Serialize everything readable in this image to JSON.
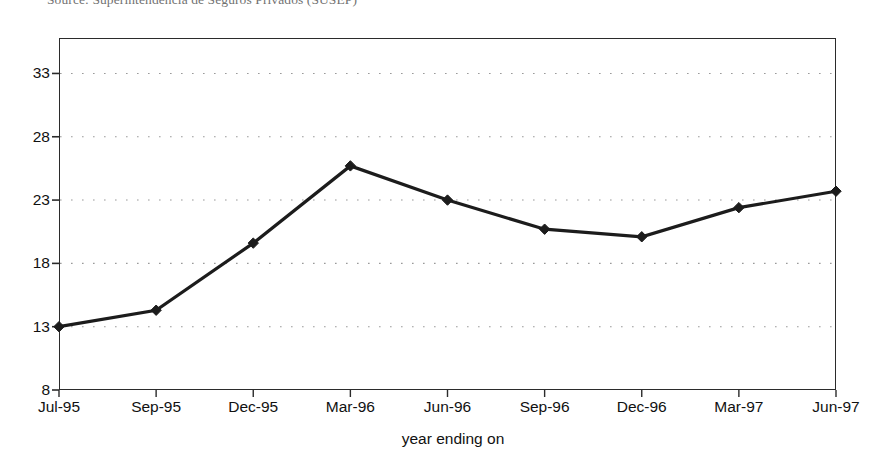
{
  "caption": {
    "source_text": "Source: Superintendência de Seguros Privados (SUSEP)"
  },
  "chart_data": {
    "type": "line",
    "title": "",
    "xlabel": "year ending on",
    "ylabel": "",
    "categories": [
      "Jul-95",
      "Sep-95",
      "Dec-95",
      "Mar-96",
      "Jun-96",
      "Sep-96",
      "Dec-96",
      "Mar-97",
      "Jun-97"
    ],
    "values": [
      13.0,
      14.3,
      19.6,
      25.7,
      23.0,
      20.7,
      20.1,
      22.4,
      23.7
    ],
    "series": [
      {
        "name": "series-1",
        "values": [
          13.0,
          14.3,
          19.6,
          25.7,
          23.0,
          20.7,
          20.1,
          22.4,
          23.7
        ]
      }
    ],
    "ylim": [
      8,
      35.8
    ],
    "yticks": [
      8,
      13,
      18,
      23,
      28,
      33
    ],
    "ytick_labels": [
      "8",
      "13",
      "18",
      "23",
      "28",
      "33"
    ],
    "xtick_labels": [
      "Jul-95",
      "Sep-95",
      "Dec-95",
      "Mar-96",
      "Jun-96",
      "Sep-96",
      "Dec-96",
      "Mar-97",
      "Jun-97"
    ],
    "grid": "horizontal-dotted",
    "legend": "none",
    "marker": "diamond",
    "line_color": "#1c1c1c",
    "grid_color": "#9a9a9a",
    "axis_color": "#2b2b2b",
    "background": "#ffffff"
  }
}
